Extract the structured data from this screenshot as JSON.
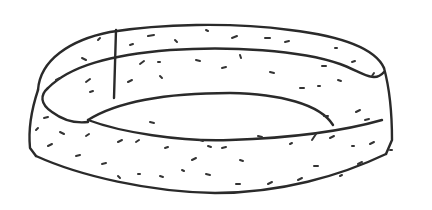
{
  "drawing": {
    "subject": "hand-drawn ring band sketch",
    "colors": {
      "ink": "#2a2a2a",
      "paper": "#ffffff",
      "speck": "#333333"
    },
    "outlines": [
      {
        "name": "outer-top-rim",
        "d": "M 38 90 C 40 60, 70 40, 110 32 C 160 24, 230 22, 290 30 C 340 36, 375 48, 384 68"
      },
      {
        "name": "inner-top-rim",
        "d": "M 48 88 C 70 66, 110 55, 170 50 C 230 46, 300 50, 340 64 C 362 72, 374 84, 384 72"
      },
      {
        "name": "hole-far-edge",
        "d": "M 88 120 C 120 100, 170 93, 230 93 C 280 94, 320 104, 333 125"
      },
      {
        "name": "hole-near-edge",
        "d": "M 88 120 C 120 132, 180 142, 230 140 C 290 138, 340 132, 382 120"
      },
      {
        "name": "inner-left-curve",
        "d": "M 48 88 C 40 95, 40 104, 52 112 C 60 118, 72 124, 88 122"
      },
      {
        "name": "seam-line",
        "d": "M 116 30 L 114 98"
      },
      {
        "name": "outer-left-side",
        "d": "M 38 90 C 32 108, 28 128, 30 148 L 36 156"
      },
      {
        "name": "outer-right-side",
        "d": "M 384 68 C 390 90, 392 115, 392 140 L 386 154"
      },
      {
        "name": "bottom-rim",
        "d": "M 36 156 C 80 176, 150 192, 215 193 C 280 193, 340 176, 386 154"
      }
    ],
    "specks": [
      "M 56 80 l 4 -2",
      "M 82 58 l 4 2",
      "M 98 40 l 2 -2",
      "M 130 45 l 3 -1",
      "M 148 36 l 6 -1",
      "M 175 40 l 2 2",
      "M 206 30 l 2 1",
      "M 232 38 l 5 -2",
      "M 265 38 l 5 0",
      "M 285 42 l 4 -1",
      "M 335 48 l 2 0",
      "M 352 62 l 3 -1",
      "M 372 76 l 2 -3",
      "M 140 64 l 4 -3",
      "M 158 62 l 2 0",
      "M 196 60 l 4 1",
      "M 222 68 l 4 -1",
      "M 240 55 l 1 3",
      "M 270 72 l 4 1",
      "M 322 66 l 4 0",
      "M 338 80 l 3 1",
      "M 128 82 l 4 -2",
      "M 160 76 l 2 2",
      "M 86 82 l 4 -3",
      "M 90 92 l 3 -1",
      "M 300 88 l 4 0",
      "M 318 86 l 2 0",
      "M 60 132 l 4 2",
      "M 86 136 l 3 -2",
      "M 150 122 l 4 1",
      "M 118 142 l 4 -2",
      "M 136 142 l 3 -2",
      "M 165 148 l 3 -1",
      "M 200 140 l 3 1",
      "M 192 160 l 4 -2",
      "M 208 146 l 3 1",
      "M 222 148 l 4 -1",
      "M 240 160 l 3 1",
      "M 258 136 l 4 1",
      "M 290 144 l 2 -1",
      "M 312 140 l 4 -6",
      "M 330 138 l 4 -2",
      "M 352 146 l 2 0",
      "M 370 144 l 4 -2",
      "M 390 150 l 2 0",
      "M 48 146 l 4 -2",
      "M 76 156 l 4 -1",
      "M 102 164 l 4 -1",
      "M 118 176 l 2 2",
      "M 138 174 l 2 0",
      "M 160 176 l 3 1",
      "M 182 170 l 2 1",
      "M 206 174 l 4 1",
      "M 236 184 l 4 0",
      "M 268 184 l 4 -2",
      "M 298 180 l 4 -2",
      "M 314 166 l 4 0",
      "M 340 176 l 2 -1",
      "M 358 164 l 4 -2",
      "M 356 112 l 4 -2",
      "M 365 120 l 4 -1",
      "M 324 116 l 4 0",
      "M 36 130 l 2 -2",
      "M 44 118 l 4 -1"
    ]
  }
}
